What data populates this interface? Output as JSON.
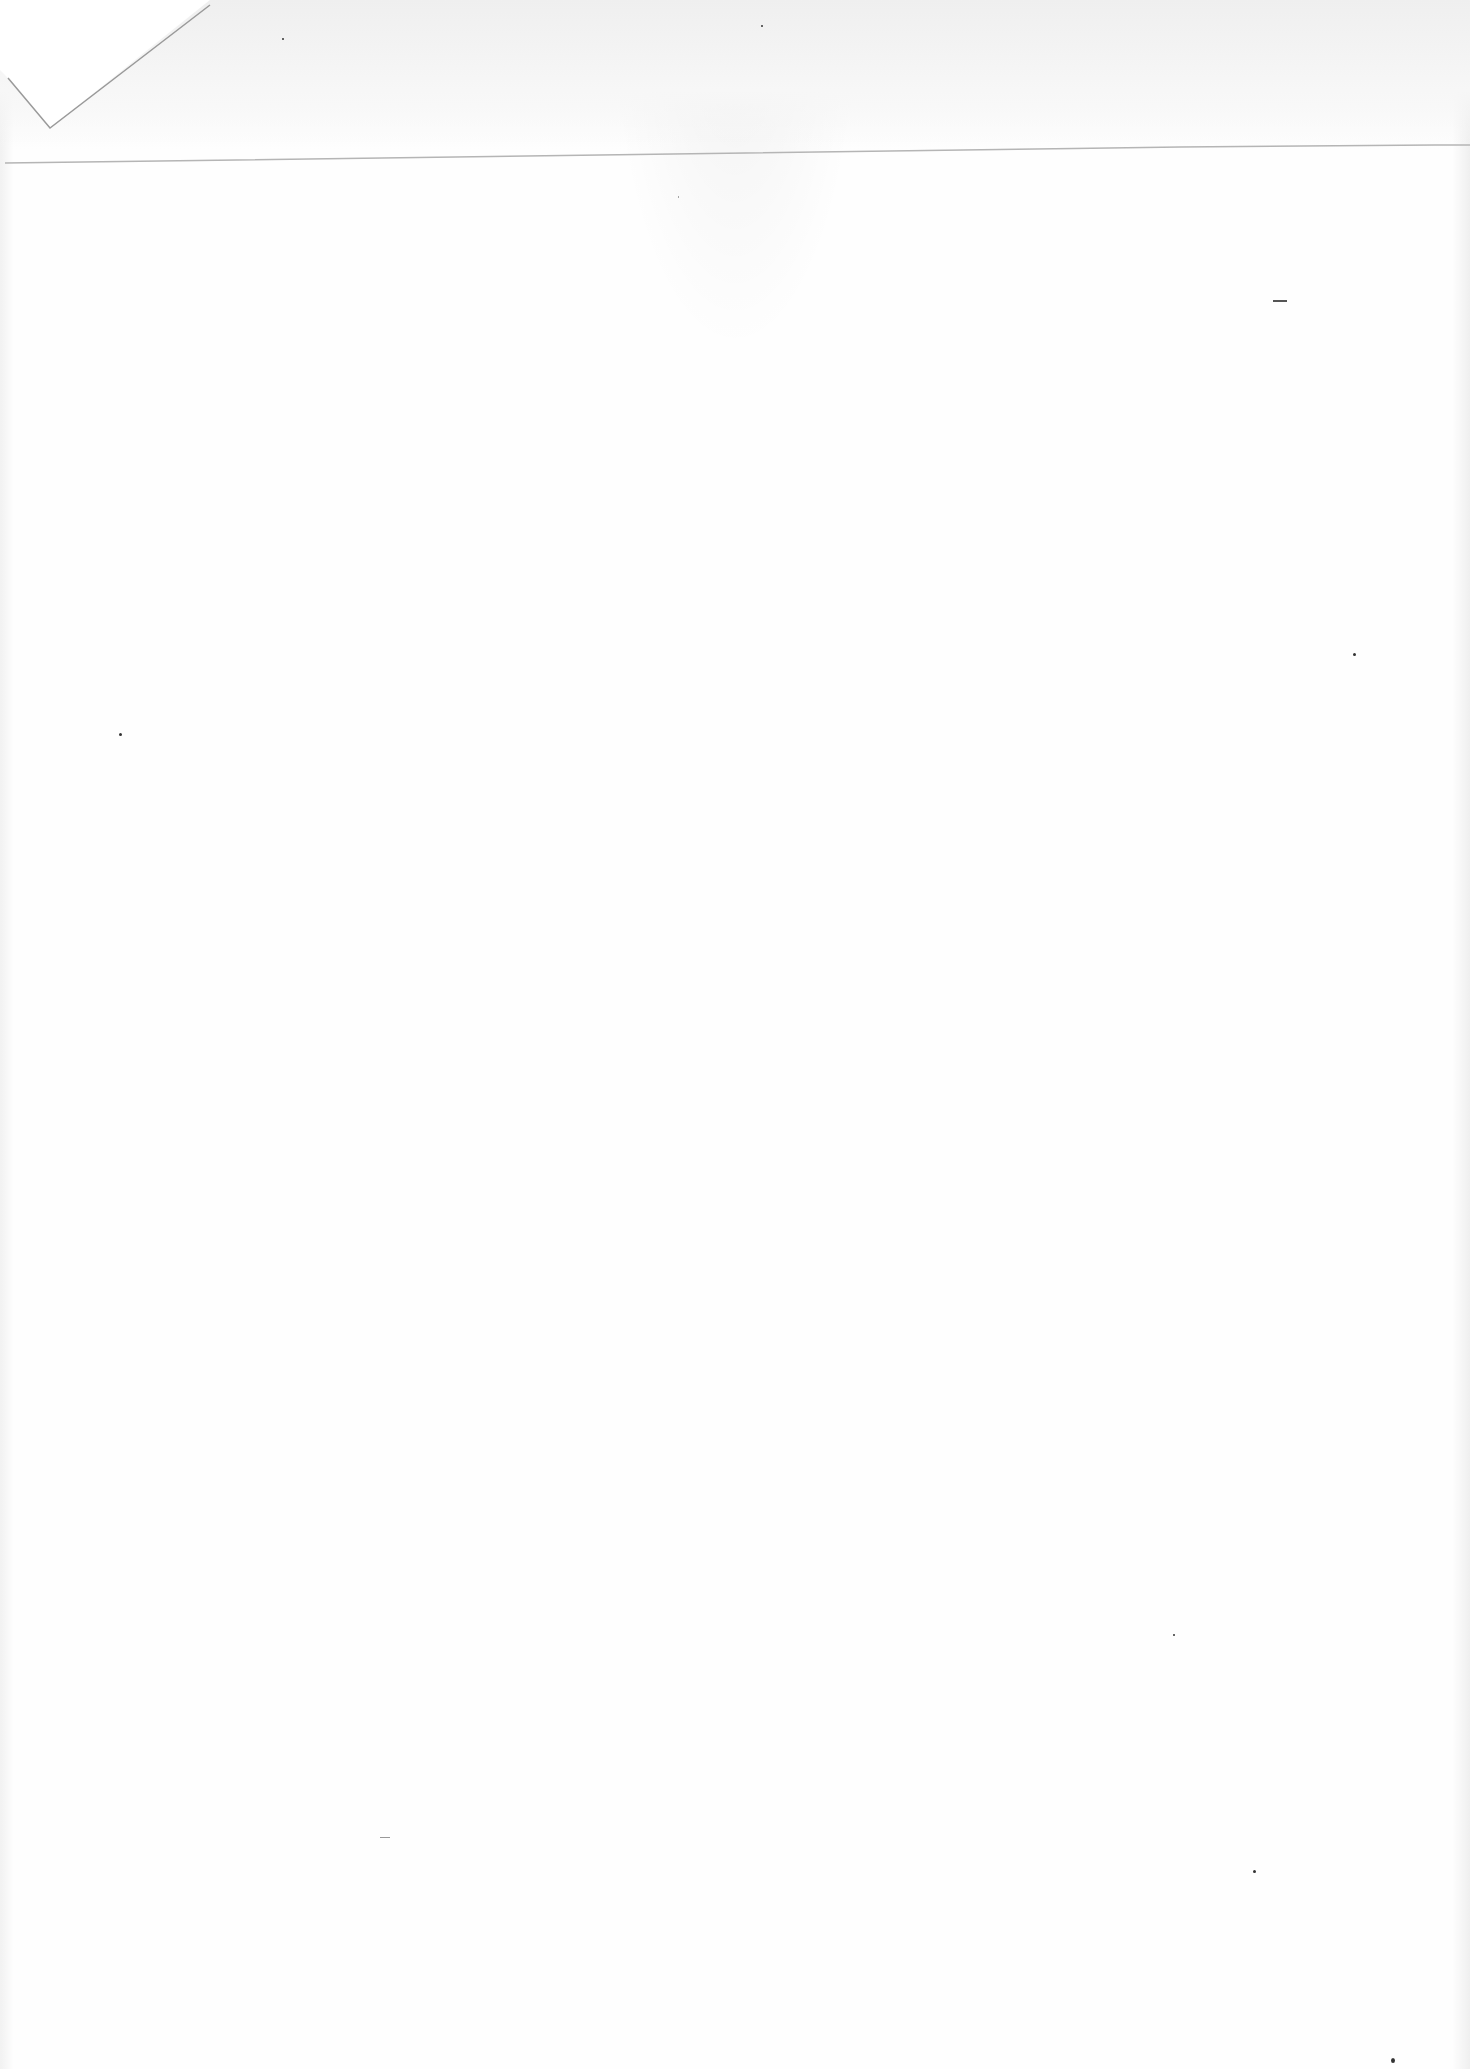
{
  "document": {
    "type": "scanned-blank-page",
    "text_content": "",
    "background_color": "#fefefe",
    "features": {
      "corner_fold": "top-left",
      "crease": "horizontal-near-top"
    }
  }
}
